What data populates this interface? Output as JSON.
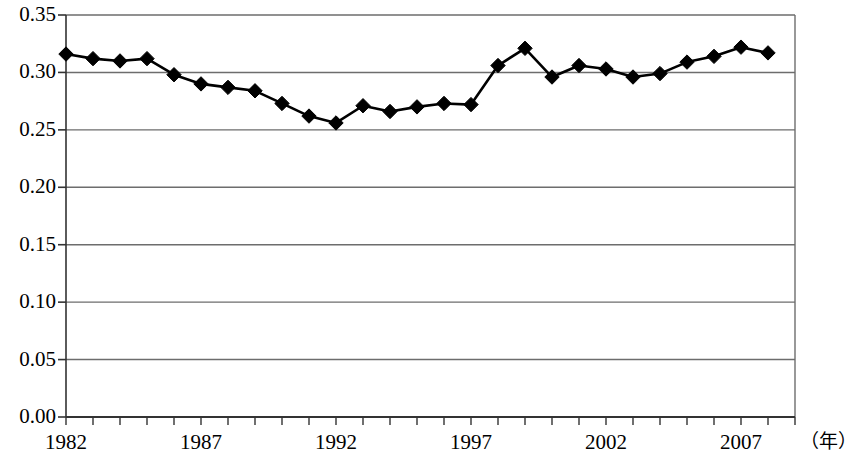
{
  "chart_data": {
    "type": "line",
    "title": "",
    "subtitle": "",
    "xlabel": "(年)",
    "ylabel": "",
    "xlim": [
      1982,
      2009
    ],
    "ylim": [
      0.0,
      0.35
    ],
    "grid": true,
    "legend": null,
    "marker": "diamond",
    "marker_color": "#000000",
    "line_color": "#000000",
    "x": [
      1982,
      1983,
      1984,
      1985,
      1986,
      1987,
      1988,
      1989,
      1990,
      1991,
      1992,
      1993,
      1994,
      1995,
      1996,
      1997,
      1998,
      1999,
      2000,
      2001,
      2002,
      2003,
      2004,
      2005,
      2006,
      2007,
      2008
    ],
    "values": [
      0.316,
      0.312,
      0.31,
      0.312,
      0.298,
      0.29,
      0.287,
      0.284,
      0.273,
      0.262,
      0.256,
      0.271,
      0.266,
      0.27,
      0.273,
      0.272,
      0.306,
      0.321,
      0.296,
      0.306,
      0.303,
      0.296,
      0.299,
      0.309,
      0.314,
      0.322,
      0.317
    ],
    "categories": [
      "1982",
      "1983",
      "1984",
      "1985",
      "1986",
      "1987",
      "1988",
      "1989",
      "1990",
      "1991",
      "1992",
      "1993",
      "1994",
      "1995",
      "1996",
      "1997",
      "1998",
      "1999",
      "2000",
      "2001",
      "2002",
      "2003",
      "2004",
      "2005",
      "2006",
      "2007",
      "2008"
    ],
    "yticks": [
      0.0,
      0.05,
      0.1,
      0.15,
      0.2,
      0.25,
      0.3,
      0.35
    ],
    "ytick_labels": [
      "0.00",
      "0.05",
      "0.10",
      "0.15",
      "0.20",
      "0.25",
      "0.30",
      "0.35"
    ],
    "xtick_labels_shown": [
      "1982",
      "1987",
      "1992",
      "1997",
      "2002",
      "2007"
    ],
    "xtick_values_shown": [
      1982,
      1987,
      1992,
      1997,
      2002,
      2007
    ]
  },
  "axis": {
    "y_labels": [
      "0.35",
      "0.30",
      "0.25",
      "0.20",
      "0.15",
      "0.10",
      "0.05",
      "0.00"
    ],
    "x_labels": [
      "1982",
      "1987",
      "1992",
      "1997",
      "2002",
      "2007"
    ],
    "x_unit": "（年）"
  },
  "colors": {
    "line": "#000000",
    "marker": "#000000",
    "grid": "#6d6d6d",
    "axis": "#333333",
    "background": "#ffffff"
  }
}
